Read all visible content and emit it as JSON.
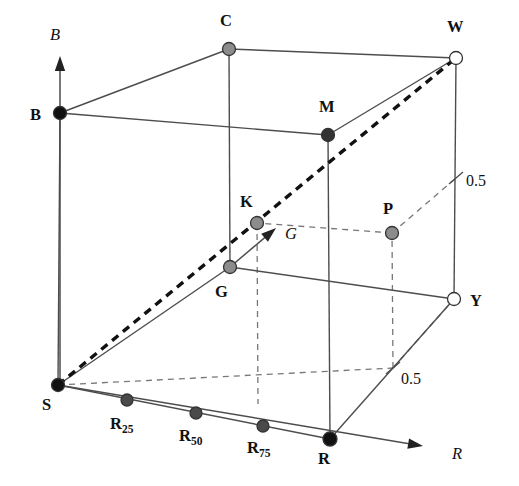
{
  "figure": {
    "background_color": "#ffffff",
    "width": 519,
    "height": 486
  },
  "axes": [
    {
      "name": "blue-axis",
      "label": "B",
      "origin": [
        60,
        385
      ],
      "tip": [
        60,
        56
      ],
      "label_pos": [
        50,
        40
      ]
    },
    {
      "name": "green-axis",
      "label": "G",
      "origin": [
        230,
        267
      ],
      "tip": [
        276,
        228
      ],
      "label_pos": [
        285,
        239
      ]
    },
    {
      "name": "red-axis",
      "label": "R",
      "origin": [
        58,
        385
      ],
      "tip": [
        423,
        446
      ],
      "label_pos": [
        452,
        459
      ]
    }
  ],
  "ticks": [
    {
      "name": "blue-half-tick",
      "label": "0.5",
      "pos": [
        456,
        178
      ],
      "label_pos": [
        466,
        186
      ]
    },
    {
      "name": "green-half-tick",
      "label": "0.5",
      "pos": [
        393,
        368
      ],
      "label_pos": [
        401,
        384
      ]
    }
  ],
  "vertices": [
    {
      "key": "S",
      "label": "S",
      "sub": "",
      "x": 58,
      "y": 385,
      "r": 6.5,
      "fill": "#111111",
      "style": "black",
      "label_pos": [
        42,
        410
      ]
    },
    {
      "key": "B",
      "label": "B",
      "sub": "",
      "x": 60,
      "y": 113,
      "r": 6.5,
      "fill": "#111111",
      "style": "black",
      "label_pos": [
        30,
        120
      ]
    },
    {
      "key": "C",
      "label": "C",
      "sub": "",
      "x": 229,
      "y": 49,
      "r": 6.5,
      "fill": "#8c8c8c",
      "style": "gray",
      "label_pos": [
        220,
        26
      ]
    },
    {
      "key": "W",
      "label": "W",
      "sub": "",
      "x": 456,
      "y": 58,
      "r": 6.5,
      "fill": "#ffffff",
      "style": "white",
      "label_pos": [
        447,
        32
      ]
    },
    {
      "key": "M",
      "label": "M",
      "sub": "",
      "x": 328,
      "y": 135,
      "r": 6.5,
      "fill": "#333333",
      "style": "darkgray",
      "label_pos": [
        319,
        112
      ]
    },
    {
      "key": "K",
      "label": "K",
      "sub": "",
      "x": 257,
      "y": 223,
      "r": 6.5,
      "fill": "#8c8c8c",
      "style": "gray",
      "label_pos": [
        240,
        207
      ]
    },
    {
      "key": "G",
      "label": "G",
      "sub": "",
      "x": 230,
      "y": 267,
      "r": 6.5,
      "fill": "#8c8c8c",
      "style": "gray",
      "label_pos": [
        215,
        297
      ]
    },
    {
      "key": "P",
      "label": "P",
      "sub": "",
      "x": 392,
      "y": 233,
      "r": 6.5,
      "fill": "#8c8c8c",
      "style": "gray",
      "label_pos": [
        383,
        214
      ]
    },
    {
      "key": "Y",
      "label": "Y",
      "sub": "",
      "x": 454,
      "y": 299,
      "r": 6.5,
      "fill": "#ffffff",
      "style": "white",
      "label_pos": [
        470,
        306
      ]
    },
    {
      "key": "R",
      "label": "R",
      "sub": "",
      "x": 330,
      "y": 439,
      "r": 7.0,
      "fill": "#111111",
      "style": "black",
      "label_pos": [
        318,
        464
      ]
    },
    {
      "key": "R25",
      "label": "R",
      "sub": "25",
      "x": 127,
      "y": 400,
      "r": 6.0,
      "fill": "#4a4a4a",
      "style": "darkgray",
      "label_pos": [
        110,
        429
      ]
    },
    {
      "key": "R50",
      "label": "R",
      "sub": "50",
      "x": 196,
      "y": 413,
      "r": 6.0,
      "fill": "#4a4a4a",
      "style": "darkgray",
      "label_pos": [
        179,
        441
      ]
    },
    {
      "key": "R75",
      "label": "R",
      "sub": "75",
      "x": 263,
      "y": 426,
      "r": 6.0,
      "fill": "#4a4a4a",
      "style": "darkgray",
      "label_pos": [
        247,
        453
      ]
    }
  ],
  "edges_solid": [
    {
      "name": "edge-B-C",
      "from": [
        60,
        113
      ],
      "to": [
        229,
        49
      ]
    },
    {
      "name": "edge-B-M",
      "from": [
        60,
        113
      ],
      "to": [
        328,
        135
      ]
    },
    {
      "name": "edge-C-W",
      "from": [
        229,
        49
      ],
      "to": [
        456,
        58
      ]
    },
    {
      "name": "edge-M-W",
      "from": [
        328,
        135
      ],
      "to": [
        456,
        58
      ]
    },
    {
      "name": "edge-B-S",
      "from": [
        60,
        113
      ],
      "to": [
        58,
        385
      ]
    },
    {
      "name": "edge-C-G",
      "from": [
        229,
        49
      ],
      "to": [
        230,
        267
      ]
    },
    {
      "name": "edge-M-R",
      "from": [
        328,
        135
      ],
      "to": [
        330,
        439
      ]
    },
    {
      "name": "edge-W-Y",
      "from": [
        456,
        58
      ],
      "to": [
        454,
        299
      ]
    },
    {
      "name": "edge-S-G",
      "from": [
        58,
        385
      ],
      "to": [
        230,
        267
      ]
    },
    {
      "name": "edge-G-Y",
      "from": [
        230,
        267
      ],
      "to": [
        454,
        299
      ]
    },
    {
      "name": "edge-S-R",
      "from": [
        58,
        385
      ],
      "to": [
        330,
        439
      ]
    },
    {
      "name": "edge-R-Y",
      "from": [
        330,
        439
      ],
      "to": [
        454,
        299
      ]
    }
  ],
  "edges_dashed": [
    {
      "name": "edge-S-hidden-corner",
      "from": [
        58,
        385
      ],
      "to": [
        393,
        368
      ]
    },
    {
      "name": "edge-hidden-corner-Y",
      "from": [
        393,
        368
      ],
      "to": [
        454,
        299
      ]
    },
    {
      "name": "edge-hidden-corner-up",
      "from": [
        393,
        368
      ],
      "to": [
        392,
        233
      ]
    },
    {
      "name": "edge-hidden-top-K",
      "from": [
        392,
        233
      ],
      "to": [
        257,
        223
      ]
    },
    {
      "name": "edge-hidden-top-W",
      "from": [
        392,
        233
      ],
      "to": [
        456,
        178
      ]
    },
    {
      "name": "edge-K-down",
      "from": [
        257,
        223
      ],
      "to": [
        258,
        404
      ]
    }
  ],
  "diagonal": {
    "name": "achromatic-diagonal",
    "label": "S-W grey axis",
    "from": [
      58,
      385
    ],
    "to": [
      456,
      58
    ]
  },
  "legend_notes": {
    "vertex_names": [
      "S",
      "B",
      "C",
      "W",
      "M",
      "K",
      "G",
      "P",
      "Y",
      "R"
    ],
    "gradient_points": [
      "R25",
      "R50",
      "R75"
    ],
    "tick_values": [
      "0.5",
      "0.5"
    ],
    "axis_labels": [
      "B",
      "G",
      "R"
    ]
  },
  "colors": {
    "edge": "#4d4d4d",
    "diagonal": "#111111",
    "node_black": "#111111",
    "node_gray": "#8c8c8c",
    "node_darkgray": "#4a4a4a",
    "node_white": "#ffffff",
    "text": "#111111",
    "background": "#ffffff"
  }
}
